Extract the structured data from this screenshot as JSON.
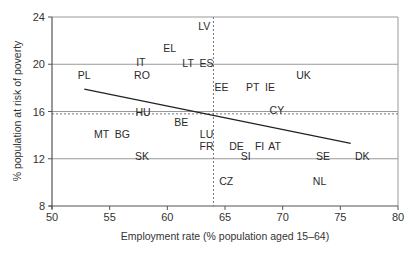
{
  "chart_data": {
    "type": "scatter",
    "title": "",
    "xlabel": "Employment rate (% population aged 15–64)",
    "ylabel": "% population at risk of poverty",
    "xlim": [
      50,
      80
    ],
    "ylim": [
      8,
      24
    ],
    "xticks": [
      50,
      55,
      60,
      65,
      70,
      75,
      80
    ],
    "yticks": [
      8,
      12,
      16,
      20,
      24
    ],
    "grid": {
      "horizontal": [
        12,
        16,
        20,
        24
      ],
      "vertical": false
    },
    "reference_lines": {
      "vertical_dashed_x": 64.0,
      "horizontal_dashed_y": 15.8
    },
    "trend_line": {
      "x": [
        52.8,
        75.9
      ],
      "y": [
        17.9,
        13.3
      ]
    },
    "points": [
      {
        "label": "LV",
        "x": 63.2,
        "y": 23.2
      },
      {
        "label": "EL",
        "x": 60.2,
        "y": 21.4
      },
      {
        "label": "IT",
        "x": 57.7,
        "y": 20.2
      },
      {
        "label": "LT",
        "x": 61.8,
        "y": 20.1
      },
      {
        "label": "ES",
        "x": 63.4,
        "y": 20.1
      },
      {
        "label": "PL",
        "x": 52.8,
        "y": 19.1
      },
      {
        "label": "RO",
        "x": 57.8,
        "y": 19.1
      },
      {
        "label": "UK",
        "x": 71.8,
        "y": 19.1
      },
      {
        "label": "EE",
        "x": 64.7,
        "y": 18.1
      },
      {
        "label": "PT",
        "x": 67.4,
        "y": 18.1
      },
      {
        "label": "IE",
        "x": 68.9,
        "y": 18.1
      },
      {
        "label": "HU",
        "x": 57.9,
        "y": 16.0
      },
      {
        "label": "CY",
        "x": 69.5,
        "y": 16.1
      },
      {
        "label": "BE",
        "x": 61.2,
        "y": 15.1
      },
      {
        "label": "MT",
        "x": 54.3,
        "y": 14.1
      },
      {
        "label": "BG",
        "x": 56.1,
        "y": 14.1
      },
      {
        "label": "LU",
        "x": 63.4,
        "y": 14.1
      },
      {
        "label": "FR",
        "x": 63.4,
        "y": 13.1
      },
      {
        "label": "DE",
        "x": 66.0,
        "y": 13.1
      },
      {
        "label": "FI",
        "x": 68.0,
        "y": 13.1
      },
      {
        "label": "AT",
        "x": 69.3,
        "y": 13.1
      },
      {
        "label": "SK",
        "x": 57.8,
        "y": 12.2
      },
      {
        "label": "SI",
        "x": 66.8,
        "y": 12.2
      },
      {
        "label": "SE",
        "x": 73.5,
        "y": 12.2
      },
      {
        "label": "DK",
        "x": 76.9,
        "y": 12.2
      },
      {
        "label": "CZ",
        "x": 65.1,
        "y": 10.1
      },
      {
        "label": "NL",
        "x": 73.2,
        "y": 10.1
      }
    ],
    "colors": {
      "text": "#2a2a2a",
      "axis": "#555555",
      "grid": "#999999",
      "trend": "#222222"
    }
  }
}
